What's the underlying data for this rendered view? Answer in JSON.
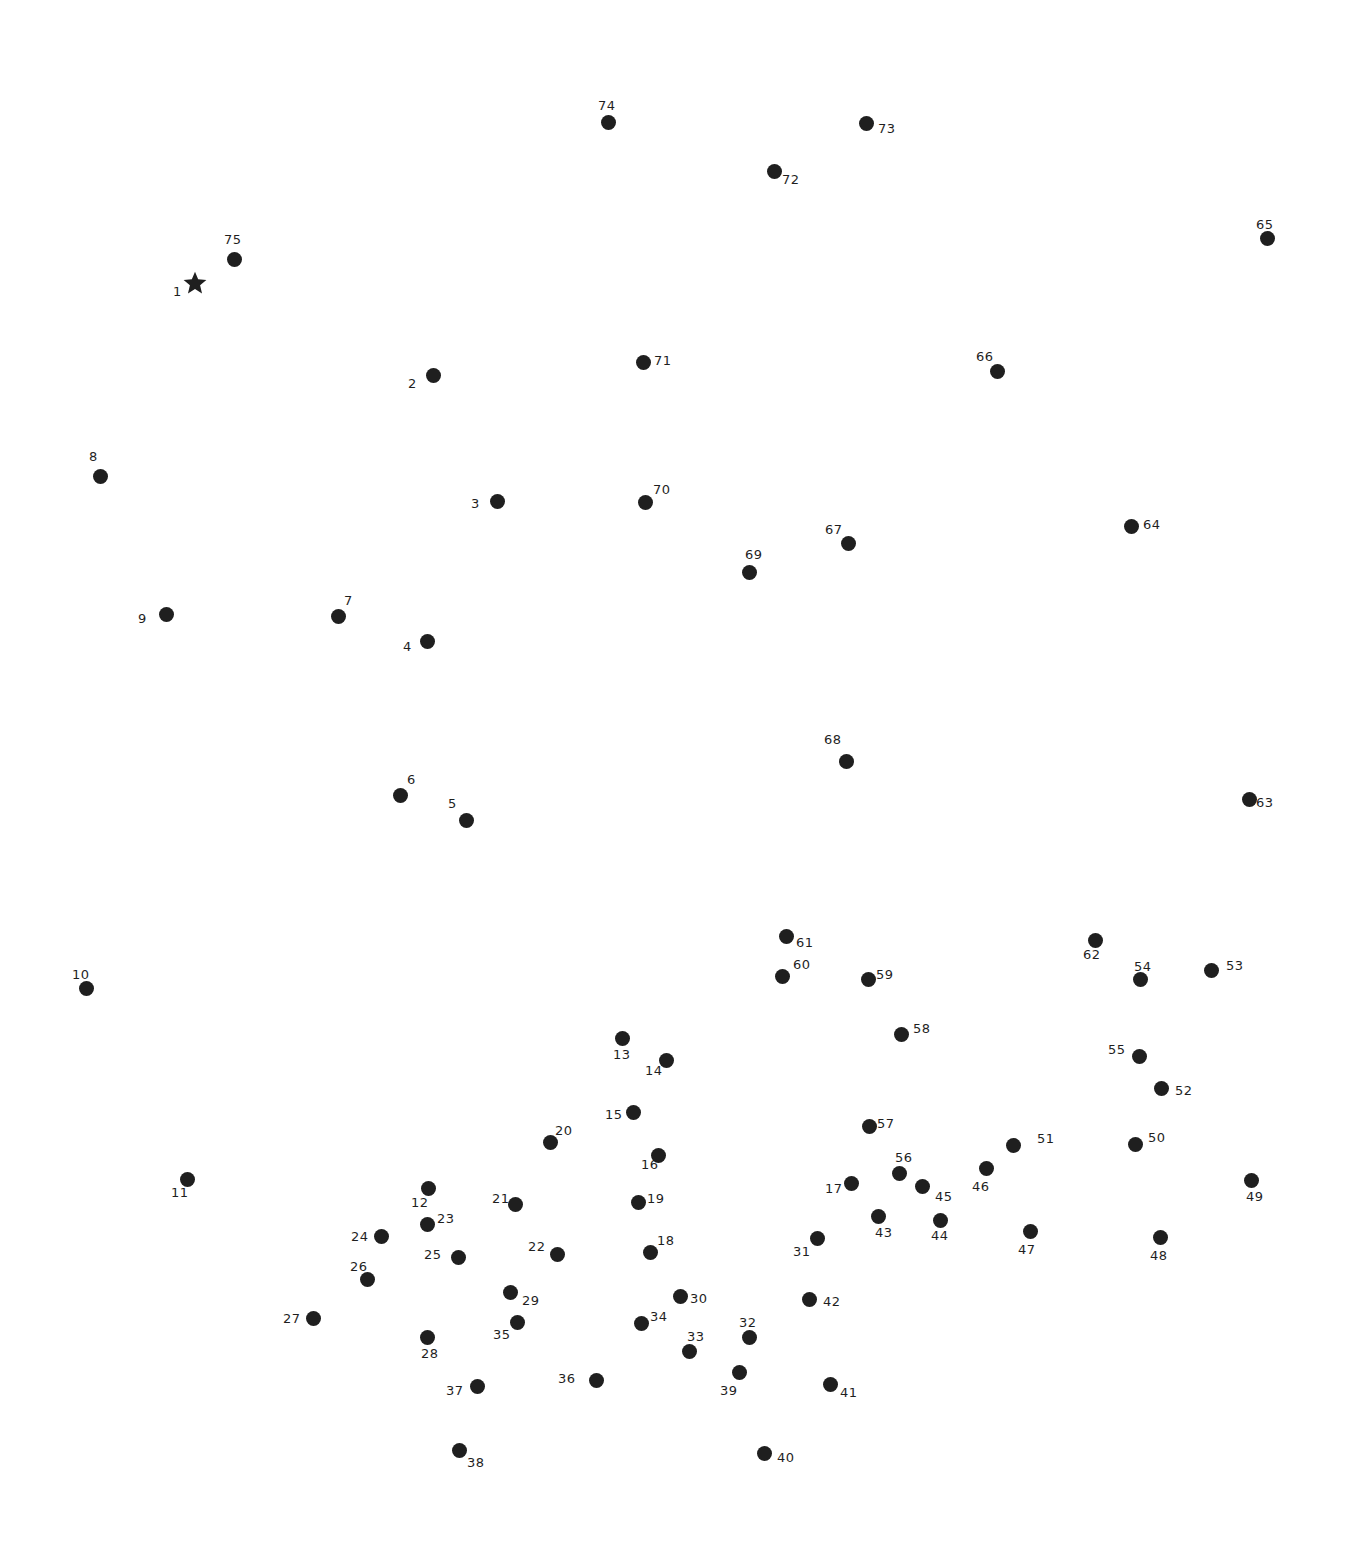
{
  "colors": {
    "dot": "#1f1f1f",
    "background": "#ffffff"
  },
  "start_marker": "star-icon",
  "dots": [
    {
      "n": "1",
      "x": 195,
      "y": 283,
      "lx": 173,
      "ly": 285,
      "start": true
    },
    {
      "n": "2",
      "x": 433,
      "y": 375,
      "lx": 408,
      "ly": 377
    },
    {
      "n": "3",
      "x": 497,
      "y": 501,
      "lx": 471,
      "ly": 497
    },
    {
      "n": "4",
      "x": 427,
      "y": 641,
      "lx": 403,
      "ly": 640
    },
    {
      "n": "5",
      "x": 466,
      "y": 820,
      "lx": 448,
      "ly": 797
    },
    {
      "n": "6",
      "x": 400,
      "y": 795,
      "lx": 407,
      "ly": 773
    },
    {
      "n": "7",
      "x": 338,
      "y": 616,
      "lx": 344,
      "ly": 594
    },
    {
      "n": "8",
      "x": 100,
      "y": 476,
      "lx": 89,
      "ly": 450
    },
    {
      "n": "9",
      "x": 166,
      "y": 614,
      "lx": 138,
      "ly": 612
    },
    {
      "n": "10",
      "x": 86,
      "y": 988,
      "lx": 72,
      "ly": 968
    },
    {
      "n": "11",
      "x": 187,
      "y": 1179,
      "lx": 171,
      "ly": 1186
    },
    {
      "n": "12",
      "x": 428,
      "y": 1188,
      "lx": 411,
      "ly": 1196
    },
    {
      "n": "13",
      "x": 622,
      "y": 1038,
      "lx": 613,
      "ly": 1048
    },
    {
      "n": "14",
      "x": 666,
      "y": 1060,
      "lx": 645,
      "ly": 1064
    },
    {
      "n": "15",
      "x": 633,
      "y": 1112,
      "lx": 605,
      "ly": 1108
    },
    {
      "n": "16",
      "x": 658,
      "y": 1155,
      "lx": 641,
      "ly": 1158
    },
    {
      "n": "17",
      "x": 851,
      "y": 1183,
      "lx": 825,
      "ly": 1182
    },
    {
      "n": "18",
      "x": 650,
      "y": 1252,
      "lx": 657,
      "ly": 1234
    },
    {
      "n": "19",
      "x": 638,
      "y": 1202,
      "lx": 647,
      "ly": 1192
    },
    {
      "n": "20",
      "x": 550,
      "y": 1142,
      "lx": 555,
      "ly": 1124
    },
    {
      "n": "21",
      "x": 515,
      "y": 1204,
      "lx": 492,
      "ly": 1192
    },
    {
      "n": "22",
      "x": 557,
      "y": 1254,
      "lx": 528,
      "ly": 1240
    },
    {
      "n": "23",
      "x": 427,
      "y": 1224,
      "lx": 437,
      "ly": 1212
    },
    {
      "n": "24",
      "x": 381,
      "y": 1236,
      "lx": 351,
      "ly": 1230
    },
    {
      "n": "25",
      "x": 458,
      "y": 1257,
      "lx": 424,
      "ly": 1248
    },
    {
      "n": "26",
      "x": 367,
      "y": 1279,
      "lx": 350,
      "ly": 1260
    },
    {
      "n": "27",
      "x": 313,
      "y": 1318,
      "lx": 283,
      "ly": 1312
    },
    {
      "n": "28",
      "x": 427,
      "y": 1337,
      "lx": 421,
      "ly": 1347
    },
    {
      "n": "29",
      "x": 510,
      "y": 1292,
      "lx": 522,
      "ly": 1294
    },
    {
      "n": "30",
      "x": 680,
      "y": 1296,
      "lx": 690,
      "ly": 1292
    },
    {
      "n": "31",
      "x": 817,
      "y": 1238,
      "lx": 793,
      "ly": 1245
    },
    {
      "n": "32",
      "x": 749,
      "y": 1337,
      "lx": 739,
      "ly": 1316
    },
    {
      "n": "33",
      "x": 689,
      "y": 1351,
      "lx": 687,
      "ly": 1330
    },
    {
      "n": "34",
      "x": 641,
      "y": 1323,
      "lx": 650,
      "ly": 1310
    },
    {
      "n": "35",
      "x": 517,
      "y": 1322,
      "lx": 493,
      "ly": 1328
    },
    {
      "n": "36",
      "x": 596,
      "y": 1380,
      "lx": 558,
      "ly": 1372
    },
    {
      "n": "37",
      "x": 477,
      "y": 1386,
      "lx": 446,
      "ly": 1384
    },
    {
      "n": "38",
      "x": 459,
      "y": 1450,
      "lx": 467,
      "ly": 1456
    },
    {
      "n": "39",
      "x": 739,
      "y": 1372,
      "lx": 720,
      "ly": 1384
    },
    {
      "n": "40",
      "x": 764,
      "y": 1453,
      "lx": 777,
      "ly": 1451
    },
    {
      "n": "41",
      "x": 830,
      "y": 1384,
      "lx": 840,
      "ly": 1386
    },
    {
      "n": "42",
      "x": 809,
      "y": 1299,
      "lx": 823,
      "ly": 1295
    },
    {
      "n": "43",
      "x": 878,
      "y": 1216,
      "lx": 875,
      "ly": 1226
    },
    {
      "n": "44",
      "x": 940,
      "y": 1220,
      "lx": 931,
      "ly": 1229
    },
    {
      "n": "45",
      "x": 922,
      "y": 1186,
      "lx": 935,
      "ly": 1190
    },
    {
      "n": "46",
      "x": 986,
      "y": 1168,
      "lx": 972,
      "ly": 1180
    },
    {
      "n": "47",
      "x": 1030,
      "y": 1231,
      "lx": 1018,
      "ly": 1243
    },
    {
      "n": "48",
      "x": 1160,
      "y": 1237,
      "lx": 1150,
      "ly": 1249
    },
    {
      "n": "49",
      "x": 1251,
      "y": 1180,
      "lx": 1246,
      "ly": 1190
    },
    {
      "n": "50",
      "x": 1135,
      "y": 1144,
      "lx": 1148,
      "ly": 1131
    },
    {
      "n": "51",
      "x": 1013,
      "y": 1145,
      "lx": 1037,
      "ly": 1132
    },
    {
      "n": "52",
      "x": 1161,
      "y": 1088,
      "lx": 1175,
      "ly": 1084
    },
    {
      "n": "53",
      "x": 1211,
      "y": 970,
      "lx": 1226,
      "ly": 959
    },
    {
      "n": "54",
      "x": 1140,
      "y": 979,
      "lx": 1134,
      "ly": 960
    },
    {
      "n": "55",
      "x": 1139,
      "y": 1056,
      "lx": 1108,
      "ly": 1043
    },
    {
      "n": "56",
      "x": 899,
      "y": 1173,
      "lx": 895,
      "ly": 1151
    },
    {
      "n": "57",
      "x": 869,
      "y": 1126,
      "lx": 877,
      "ly": 1117
    },
    {
      "n": "58",
      "x": 901,
      "y": 1034,
      "lx": 913,
      "ly": 1022
    },
    {
      "n": "59",
      "x": 868,
      "y": 979,
      "lx": 876,
      "ly": 968
    },
    {
      "n": "60",
      "x": 782,
      "y": 976,
      "lx": 793,
      "ly": 958
    },
    {
      "n": "61",
      "x": 786,
      "y": 936,
      "lx": 796,
      "ly": 936
    },
    {
      "n": "62",
      "x": 1095,
      "y": 940,
      "lx": 1083,
      "ly": 948
    },
    {
      "n": "63",
      "x": 1249,
      "y": 799,
      "lx": 1256,
      "ly": 796
    },
    {
      "n": "64",
      "x": 1131,
      "y": 526,
      "lx": 1143,
      "ly": 518
    },
    {
      "n": "65",
      "x": 1267,
      "y": 238,
      "lx": 1256,
      "ly": 218
    },
    {
      "n": "66",
      "x": 997,
      "y": 371,
      "lx": 976,
      "ly": 350
    },
    {
      "n": "67",
      "x": 848,
      "y": 543,
      "lx": 825,
      "ly": 523
    },
    {
      "n": "68",
      "x": 846,
      "y": 761,
      "lx": 824,
      "ly": 733
    },
    {
      "n": "69",
      "x": 749,
      "y": 572,
      "lx": 745,
      "ly": 548
    },
    {
      "n": "70",
      "x": 645,
      "y": 502,
      "lx": 653,
      "ly": 483
    },
    {
      "n": "71",
      "x": 643,
      "y": 362,
      "lx": 654,
      "ly": 354
    },
    {
      "n": "72",
      "x": 774,
      "y": 171,
      "lx": 782,
      "ly": 173
    },
    {
      "n": "73",
      "x": 866,
      "y": 123,
      "lx": 878,
      "ly": 122
    },
    {
      "n": "74",
      "x": 608,
      "y": 122,
      "lx": 598,
      "ly": 99
    },
    {
      "n": "75",
      "x": 234,
      "y": 259,
      "lx": 224,
      "ly": 233
    }
  ]
}
